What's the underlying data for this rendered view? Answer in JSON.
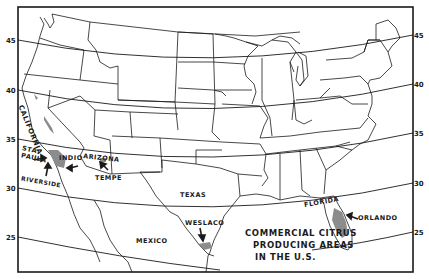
{
  "map": {
    "title_lines": [
      "COMMERCIAL CITRUS",
      "PRODUCING AREAS",
      "IN THE U.S."
    ],
    "place_labels": {
      "california": "CALIFORNIA",
      "sta": "STA.",
      "paula": "PAULA",
      "riverside": "RIVERSIDE",
      "indio": "INDIO",
      "arizona": "ARIZONA",
      "tempe": "TEMPE",
      "texas": "TEXAS",
      "weslaco": "WESLACO",
      "mexico": "MEXICO",
      "florida": "FLORIDA",
      "orlando": "ORLANDO"
    },
    "latitudes_left": [
      "45",
      "40",
      "35",
      "30",
      "25"
    ],
    "latitudes_right": [
      "45",
      "40",
      "35",
      "30",
      "25"
    ],
    "colors": {
      "ink": "#1a1a1a",
      "citrus_area": "#8c8c8c",
      "background": "#ffffff"
    }
  }
}
